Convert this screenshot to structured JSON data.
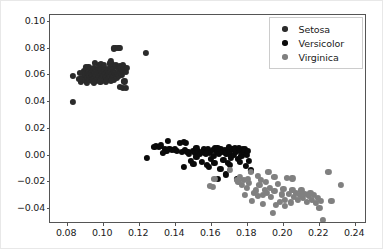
{
  "chart_data": {
    "type": "scatter",
    "title": "",
    "xlabel": "",
    "ylabel": "",
    "xlim": [
      0.0705,
      0.2455
    ],
    "ylim": [
      -0.0505,
      0.1045
    ],
    "grid": false,
    "legend_position": "upper right",
    "xticks": [
      0.08,
      0.1,
      0.12,
      0.14,
      0.16,
      0.18,
      0.2,
      0.22,
      0.24
    ],
    "xtick_labels": [
      "0.08",
      "0.10",
      "0.12",
      "0.14",
      "0.16",
      "0.18",
      "0.20",
      "0.22",
      "0.24"
    ],
    "yticks": [
      -0.04,
      -0.02,
      0.0,
      0.02,
      0.04,
      0.06,
      0.08,
      0.1
    ],
    "ytick_labels": [
      "−0.04",
      "−0.02",
      "0.00",
      "0.02",
      "0.04",
      "0.06",
      "0.08",
      "0.10"
    ],
    "marker_size": 6.2,
    "series": [
      {
        "name": "Setosa",
        "color": "#2b2b2b",
        "points": [
          [
            0.0832,
            0.059
          ],
          [
            0.083,
            0.0392
          ],
          [
            0.0878,
            0.0545
          ],
          [
            0.0884,
            0.057
          ],
          [
            0.0892,
            0.0627
          ],
          [
            0.0896,
            0.0558
          ],
          [
            0.0901,
            0.06
          ],
          [
            0.0905,
            0.0652
          ],
          [
            0.0908,
            0.0535
          ],
          [
            0.0912,
            0.0582
          ],
          [
            0.0915,
            0.0612
          ],
          [
            0.0918,
            0.0658
          ],
          [
            0.0921,
            0.0562
          ],
          [
            0.0924,
            0.0598
          ],
          [
            0.0927,
            0.064
          ],
          [
            0.093,
            0.0575
          ],
          [
            0.0933,
            0.061
          ],
          [
            0.0936,
            0.0555
          ],
          [
            0.0939,
            0.0595
          ],
          [
            0.0942,
            0.0633
          ],
          [
            0.0945,
            0.0568
          ],
          [
            0.0948,
            0.0605
          ],
          [
            0.0951,
            0.0648
          ],
          [
            0.0954,
            0.0578
          ],
          [
            0.0957,
            0.0615
          ],
          [
            0.096,
            0.0552
          ],
          [
            0.0963,
            0.0592
          ],
          [
            0.0966,
            0.063
          ],
          [
            0.0969,
            0.057
          ],
          [
            0.0972,
            0.0608
          ],
          [
            0.0975,
            0.0645
          ],
          [
            0.0978,
            0.0585
          ],
          [
            0.0981,
            0.062
          ],
          [
            0.0984,
            0.056
          ],
          [
            0.0987,
            0.06
          ],
          [
            0.099,
            0.0638
          ],
          [
            0.0993,
            0.0575
          ],
          [
            0.0996,
            0.0612
          ],
          [
            0.0999,
            0.0655
          ],
          [
            0.1002,
            0.059
          ],
          [
            0.1005,
            0.0625
          ],
          [
            0.1008,
            0.0565
          ],
          [
            0.1011,
            0.0602
          ],
          [
            0.1014,
            0.0642
          ],
          [
            0.1017,
            0.058
          ],
          [
            0.102,
            0.0618
          ],
          [
            0.1023,
            0.0558
          ],
          [
            0.1026,
            0.0596
          ],
          [
            0.1029,
            0.0635
          ],
          [
            0.1032,
            0.0572
          ],
          [
            0.1035,
            0.061
          ],
          [
            0.1038,
            0.065
          ],
          [
            0.1041,
            0.0588
          ],
          [
            0.1044,
            0.0622
          ],
          [
            0.1047,
            0.0566
          ],
          [
            0.105,
            0.0604
          ],
          [
            0.1053,
            0.0645
          ],
          [
            0.1056,
            0.0582
          ],
          [
            0.1059,
            0.0616
          ],
          [
            0.1062,
            0.056
          ],
          [
            0.106,
            0.0795
          ],
          [
            0.1068,
            0.0798
          ],
          [
            0.1085,
            0.08
          ],
          [
            0.1092,
            0.0796
          ],
          [
            0.104,
            0.0682
          ],
          [
            0.105,
            0.0678
          ],
          [
            0.1072,
            0.0668
          ],
          [
            0.108,
            0.0655
          ],
          [
            0.1088,
            0.064
          ],
          [
            0.1095,
            0.0662
          ],
          [
            0.1102,
            0.0648
          ],
          [
            0.1108,
            0.0672
          ],
          [
            0.1065,
            0.0612
          ],
          [
            0.107,
            0.0595
          ],
          [
            0.1076,
            0.0578
          ],
          [
            0.1082,
            0.0608
          ],
          [
            0.109,
            0.0592
          ],
          [
            0.1098,
            0.0615
          ],
          [
            0.1104,
            0.06
          ],
          [
            0.111,
            0.063
          ],
          [
            0.1115,
            0.0652
          ],
          [
            0.112,
            0.064
          ],
          [
            0.1125,
            0.0618
          ],
          [
            0.113,
            0.0648
          ],
          [
            0.1095,
            0.0505
          ],
          [
            0.1112,
            0.0502
          ],
          [
            0.1118,
            0.0548
          ],
          [
            0.1128,
            0.05
          ],
          [
            0.0955,
            0.0688
          ],
          [
            0.0975,
            0.0672
          ],
          [
            0.099,
            0.068
          ],
          [
            0.1005,
            0.067
          ],
          [
            0.0868,
            0.0565
          ],
          [
            0.0872,
            0.0612
          ],
          [
            0.124,
            0.0762
          ],
          [
            0.1045,
            0.07
          ],
          [
            0.0948,
            0.054
          ],
          [
            0.0985,
            0.0548
          ],
          [
            0.1015,
            0.0545
          ],
          [
            0.1042,
            0.0552
          ]
        ]
      },
      {
        "name": "Versicolor",
        "color": "#0a0a0a",
        "points": [
          [
            0.1242,
            -0.0028
          ],
          [
            0.1285,
            0.0055
          ],
          [
            0.1295,
            0.0062
          ],
          [
            0.1308,
            0.006
          ],
          [
            0.1322,
            0.0068
          ],
          [
            0.1345,
            0.004
          ],
          [
            0.1358,
            0.0105
          ],
          [
            0.1368,
            0.0042
          ],
          [
            0.1382,
            0.0032
          ],
          [
            0.1398,
            0.0038
          ],
          [
            0.1412,
            0.003
          ],
          [
            0.1425,
            0.0085
          ],
          [
            0.1438,
            0.0018
          ],
          [
            0.1448,
            -0.009
          ],
          [
            0.1455,
            0.0035
          ],
          [
            0.1468,
            0.002
          ],
          [
            0.1478,
            0.0008
          ],
          [
            0.1488,
            -0.0048
          ],
          [
            0.1498,
            0.0025
          ],
          [
            0.1508,
            0.0012
          ],
          [
            0.1518,
            -0.002
          ],
          [
            0.1528,
            0.003
          ],
          [
            0.1538,
            0.0002
          ],
          [
            0.1548,
            -0.0055
          ],
          [
            0.1558,
            0.0038
          ],
          [
            0.1568,
            0.0015
          ],
          [
            0.1575,
            -0.0078
          ],
          [
            0.1582,
            0.0042
          ],
          [
            0.1592,
            0.001
          ],
          [
            0.1598,
            -0.003
          ],
          [
            0.1608,
            0.0035
          ],
          [
            0.1615,
            -0.0008
          ],
          [
            0.1622,
            0.0048
          ],
          [
            0.1632,
            0.0022
          ],
          [
            0.1638,
            -0.018
          ],
          [
            0.1645,
            0.0005
          ],
          [
            0.1652,
            0.004
          ],
          [
            0.1662,
            0.0018
          ],
          [
            0.1668,
            -0.0042
          ],
          [
            0.1678,
            0.0032
          ],
          [
            0.1685,
            0.0008
          ],
          [
            0.1692,
            -0.0062
          ],
          [
            0.1698,
            0.0038
          ],
          [
            0.1705,
            0.0015
          ],
          [
            0.1712,
            -0.0022
          ],
          [
            0.1718,
            0.0042
          ],
          [
            0.1725,
            0.0
          ],
          [
            0.1732,
            0.0048
          ],
          [
            0.174,
            0.002
          ],
          [
            0.1748,
            -0.0035
          ],
          [
            0.1755,
            0.0052
          ],
          [
            0.1762,
            0.0025
          ],
          [
            0.1768,
            -0.001
          ],
          [
            0.1775,
            0.0045
          ],
          [
            0.1782,
            0.0018
          ],
          [
            0.179,
            0.0038
          ],
          [
            0.1798,
            -0.0005
          ],
          [
            0.1805,
            0.003
          ],
          [
            0.1812,
            -0.0048
          ],
          [
            0.182,
            -0.0118
          ],
          [
            0.1682,
            -0.0148
          ],
          [
            0.1742,
            -0.018
          ],
          [
            0.1618,
            -0.0065
          ],
          [
            0.1548,
            0.0018
          ],
          [
            0.1462,
            0.0088
          ],
          [
            0.1352,
            0.0028
          ],
          [
            0.133,
            0.0012
          ],
          [
            0.1502,
            -0.0068
          ],
          [
            0.1588,
            -0.0095
          ],
          [
            0.1652,
            -0.0105
          ],
          [
            0.1705,
            -0.0075
          ],
          [
            0.1758,
            -0.0058
          ],
          [
            0.1795,
            -0.0082
          ],
          [
            0.1822,
            -0.0125
          ],
          [
            0.1635,
            0.005
          ],
          [
            0.17,
            0.0055
          ],
          [
            0.1448,
            0.0092
          ],
          [
            0.1472,
            0.0018
          ],
          [
            0.1518,
            0.0048
          ],
          [
            0.1572,
            0.0008
          ]
        ]
      },
      {
        "name": "Virginica",
        "color": "#808080",
        "points": [
          [
            0.1595,
            -0.0232
          ],
          [
            0.1612,
            -0.0245
          ],
          [
            0.1618,
            -0.0185
          ],
          [
            0.1705,
            -0.0112
          ],
          [
            0.1742,
            -0.0188
          ],
          [
            0.1752,
            -0.0205
          ],
          [
            0.1762,
            -0.0165
          ],
          [
            0.1772,
            -0.0225
          ],
          [
            0.1782,
            -0.0192
          ],
          [
            0.179,
            -0.03
          ],
          [
            0.1798,
            -0.0252
          ],
          [
            0.1805,
            -0.018
          ],
          [
            0.1812,
            -0.0215
          ],
          [
            0.182,
            -0.0128
          ],
          [
            0.1828,
            -0.0345
          ],
          [
            0.1838,
            -0.0288
          ],
          [
            0.1848,
            -0.0268
          ],
          [
            0.1858,
            -0.0312
          ],
          [
            0.1868,
            -0.0225
          ],
          [
            0.1878,
            -0.0192
          ],
          [
            0.1888,
            -0.0302
          ],
          [
            0.1898,
            -0.0262
          ],
          [
            0.1905,
            -0.0205
          ],
          [
            0.1912,
            -0.0285
          ],
          [
            0.1918,
            -0.0128
          ],
          [
            0.1925,
            -0.0248
          ],
          [
            0.1932,
            -0.0318
          ],
          [
            0.1942,
            -0.0435
          ],
          [
            0.1952,
            -0.0272
          ],
          [
            0.1962,
            -0.0375
          ],
          [
            0.1972,
            -0.0222
          ],
          [
            0.1982,
            -0.0352
          ],
          [
            0.1992,
            -0.0298
          ],
          [
            0.2002,
            -0.0258
          ],
          [
            0.2012,
            -0.0338
          ],
          [
            0.2022,
            -0.0172
          ],
          [
            0.2032,
            -0.0295
          ],
          [
            0.2042,
            -0.0358
          ],
          [
            0.2052,
            -0.0262
          ],
          [
            0.2062,
            -0.0318
          ],
          [
            0.2072,
            -0.0288
          ],
          [
            0.2082,
            -0.0342
          ],
          [
            0.2092,
            -0.0302
          ],
          [
            0.2102,
            -0.0268
          ],
          [
            0.2112,
            -0.0325
          ],
          [
            0.2122,
            -0.0295
          ],
          [
            0.2132,
            -0.0355
          ],
          [
            0.2142,
            -0.0312
          ],
          [
            0.2152,
            -0.0285
          ],
          [
            0.2162,
            -0.0338
          ],
          [
            0.2172,
            -0.0302
          ],
          [
            0.2182,
            -0.0362
          ],
          [
            0.2192,
            -0.0322
          ],
          [
            0.2202,
            -0.0398
          ],
          [
            0.2212,
            -0.0348
          ],
          [
            0.2222,
            -0.0488
          ],
          [
            0.2252,
            -0.0132
          ],
          [
            0.2268,
            -0.0345
          ],
          [
            0.2322,
            -0.0228
          ],
          [
            0.1862,
            -0.0158
          ],
          [
            0.1952,
            -0.0168
          ],
          [
            0.2052,
            -0.0178
          ],
          [
            0.1888,
            -0.0368
          ],
          [
            0.2008,
            -0.0382
          ]
        ]
      }
    ]
  },
  "legend": {
    "entries": [
      {
        "label": "Setosa",
        "color": "#2b2b2b"
      },
      {
        "label": "Versicolor",
        "color": "#0a0a0a"
      },
      {
        "label": "Virginica",
        "color": "#808080"
      }
    ]
  }
}
